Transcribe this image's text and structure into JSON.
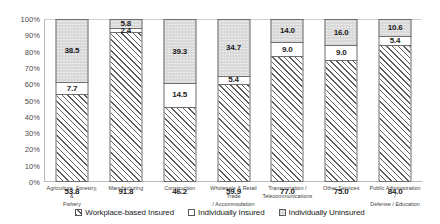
{
  "chart_data": {
    "type": "bar",
    "subtype": "stacked-100-percent",
    "title": "",
    "xlabel": "",
    "ylabel": "",
    "ylim": [
      0,
      100
    ],
    "ytick_labels": [
      "100%",
      "90%",
      "80%",
      "70%",
      "60%",
      "50%",
      "40%",
      "30%",
      "20%",
      "10%",
      "0%"
    ],
    "ytick_values": [
      100,
      90,
      80,
      70,
      60,
      50,
      40,
      30,
      20,
      10,
      0
    ],
    "grid": true,
    "legend_position": "bottom",
    "categories": [
      "Agriculture, Forestry, & Fishery",
      "Manufacturing",
      "Construction",
      "Wholesale & Retail Trade / Accommodation",
      "Transportation / Telecommunications",
      "Other Services",
      "Public Administration / Defense / Education"
    ],
    "series": [
      {
        "name": "Workplace-based Insured",
        "pattern": "diagonal-hatch",
        "values": [
          53.8,
          91.8,
          46.2,
          59.9,
          77.0,
          75.0,
          84.0
        ]
      },
      {
        "name": "Individually Insured",
        "pattern": "white",
        "values": [
          7.7,
          2.4,
          14.5,
          5.4,
          9.0,
          9.0,
          5.4
        ]
      },
      {
        "name": "Individually Uninsured",
        "pattern": "dotted-gray",
        "values": [
          38.5,
          5.8,
          39.3,
          34.7,
          14.0,
          16.0,
          10.6
        ]
      }
    ]
  },
  "categories_display": [
    [
      "Agriculture, Forestry, &",
      "Fishery"
    ],
    [
      "Manufacturing"
    ],
    [
      "Construction"
    ],
    [
      "Wholesale & Retail Trade",
      "/ Accommodation"
    ],
    [
      "Transportation /",
      "Telecommunications"
    ],
    [
      "Other Services"
    ],
    [
      "Public Administration /",
      "Defense / Education"
    ]
  ],
  "legend": {
    "items": [
      {
        "label": "Workplace-based Insured",
        "pattern": "diagonal-hatch"
      },
      {
        "label": "Individually Insured",
        "pattern": "white"
      },
      {
        "label": "Individually Uninsured",
        "pattern": "dotted-gray"
      }
    ]
  },
  "colors": {
    "hatch_line": "#5d5d5d",
    "dots_fill": "#d9d9d9",
    "white_fill": "#ffffff",
    "segment_border": "#6e6e6e",
    "axis": "#b9b9b9",
    "gridline": "#e2e2e2",
    "label_text": "#3c3c3c",
    "value_text": "#1a1a1a"
  }
}
